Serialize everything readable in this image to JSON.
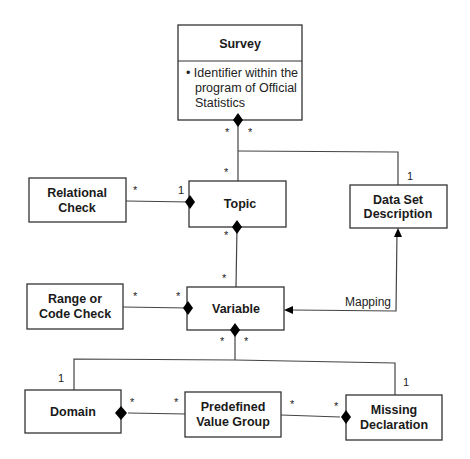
{
  "diagram": {
    "type": "UML class diagram",
    "classes": {
      "survey": {
        "name": "Survey",
        "attribute_lines": [
          "• Identifier within the",
          "program of Official",
          "Statistics"
        ]
      },
      "topic": {
        "name": "Topic"
      },
      "relational_check": {
        "name_lines": [
          "Relational",
          "Check"
        ]
      },
      "data_set_description": {
        "name_lines": [
          "Data Set",
          "Description"
        ]
      },
      "variable": {
        "name": "Variable"
      },
      "range_or_code_check": {
        "name_lines": [
          "Range or",
          "Code Check"
        ]
      },
      "domain": {
        "name": "Domain"
      },
      "predefined_value_group": {
        "name_lines": [
          "Predefined",
          "Value Group"
        ]
      },
      "missing_declaration": {
        "name_lines": [
          "Missing",
          "Declaration"
        ]
      }
    },
    "multiplicities": {
      "survey_topic_left": "*",
      "survey_topic_right": "*",
      "topic_end": "*",
      "dataset_end": "1",
      "relcheck_end": "*",
      "topic_relcheck_end": "1",
      "topic_variable_top": "*",
      "variable_topic_end": "*",
      "rangecheck_end": "*",
      "variable_rangecheck_end": "*",
      "variable_bottom_left": "*",
      "variable_bottom_right": "*",
      "domain_end": "1",
      "missing_end": "1",
      "domain_pvg_end": "*",
      "pvg_domain_end": "*",
      "pvg_missing_end": "*",
      "missing_pvg_end": "*"
    },
    "association_labels": {
      "mapping": "Mapping"
    }
  }
}
